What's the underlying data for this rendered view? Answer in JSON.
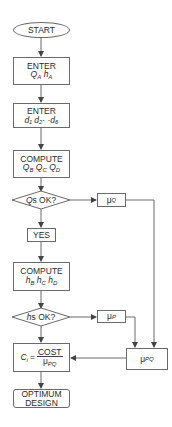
{
  "flowchart": {
    "start": {
      "label": "START"
    },
    "enter_q": {
      "label": "ENTER",
      "vars": [
        {
          "base": "Q",
          "sub": "A"
        },
        {
          "base": "h",
          "sub": "A"
        }
      ]
    },
    "enter_d": {
      "label": "ENTER",
      "expr": "d₁  d₂· ·d₆"
    },
    "compute_q": {
      "label": "COMPUTE",
      "vars": [
        {
          "base": "Q",
          "sub": "B"
        },
        {
          "base": "Q",
          "sub": "C"
        },
        {
          "base": "Q",
          "sub": "D"
        }
      ]
    },
    "decision_q": {
      "prefix": "Q",
      "label": "s OK?"
    },
    "mu_q": {
      "base": "μ",
      "sub": "Q"
    },
    "yes": {
      "label": "YES"
    },
    "compute_h": {
      "label": "COMPUTE",
      "vars": [
        {
          "base": "h",
          "sub": "B"
        },
        {
          "base": "h",
          "sub": "C"
        },
        {
          "base": "h",
          "sub": "D"
        }
      ]
    },
    "decision_h": {
      "prefix": "h",
      "label": "s OK?"
    },
    "mu_p": {
      "base": "μ",
      "sub": "P"
    },
    "cost": {
      "lhs": "C",
      "lhs_sub": "i",
      "eq": "=",
      "numerator": "COST",
      "den_base": "μ",
      "den_sub": "PQ"
    },
    "mu_pq": {
      "base": "μ",
      "sub": "PQ"
    },
    "optimum": {
      "line1": "OPTIMUM",
      "line2": "DESIGN"
    }
  },
  "colors": {
    "line": "#6a6a6a",
    "text": "#2a2a2a",
    "background": "#ffffff"
  }
}
